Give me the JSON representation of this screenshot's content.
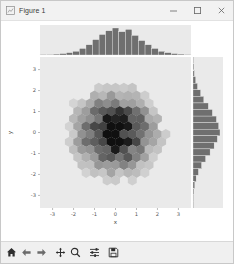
{
  "window": {
    "title": "Figure 1",
    "icon": "figure-icon",
    "controls": [
      {
        "name": "minimize-button",
        "glyph": "minimize-icon",
        "label": "Minimize"
      },
      {
        "name": "maximize-button",
        "glyph": "maximize-icon",
        "label": "Maximize"
      },
      {
        "name": "close-button",
        "glyph": "close-icon",
        "label": "Close"
      }
    ]
  },
  "toolbar": {
    "buttons": [
      {
        "name": "home-button",
        "icon": "home-icon",
        "label": "Reset original view"
      },
      {
        "name": "back-button",
        "icon": "arrow-left-icon",
        "label": "Back to previous view"
      },
      {
        "name": "forward-button",
        "icon": "arrow-right-icon",
        "label": "Forward to next view"
      },
      {
        "name": "pan-button",
        "icon": "move-cross-icon",
        "label": "Pan axes with left mouse, zoom with right"
      },
      {
        "name": "zoom-button",
        "icon": "magnifier-icon",
        "label": "Zoom to rectangle"
      },
      {
        "name": "configure-subplots-button",
        "icon": "sliders-icon",
        "label": "Configure subplots"
      },
      {
        "name": "save-button",
        "icon": "floppy-disk-icon",
        "label": "Save the figure"
      }
    ]
  },
  "chart_data": {
    "type": "scatter",
    "plot_kind": "hexbin-with-marginal-histograms",
    "title": "",
    "xlabel": "x",
    "ylabel": "y",
    "xlim": [
      -3.6,
      3.6
    ],
    "ylim": [
      -3.6,
      3.6
    ],
    "xticks": [
      -3,
      -2,
      -1,
      0,
      1,
      2,
      3
    ],
    "yticks": [
      -3,
      -2,
      -1,
      0,
      1,
      2,
      3
    ],
    "grid": false,
    "legend": null,
    "colormap": "gray_r",
    "axes_facecolor": "#eaeaea",
    "marginal_bar_color": "#6f6f6f",
    "hexbin": {
      "gridsize": 18,
      "center": [
        0.0,
        0.0
      ],
      "note": "bivariate normal density, counts mapped to grayscale, dark = high count"
    },
    "top_histogram": {
      "orientation": "vertical",
      "bin_centers": [
        -3.25,
        -2.95,
        -2.65,
        -2.35,
        -2.05,
        -1.75,
        -1.45,
        -1.15,
        -0.85,
        -0.55,
        -0.25,
        0.05,
        0.35,
        0.65,
        0.95,
        1.25,
        1.55,
        1.85,
        2.15,
        2.45,
        2.75,
        3.05,
        3.35
      ],
      "counts": [
        1,
        1,
        2,
        3,
        5,
        8,
        14,
        22,
        33,
        44,
        52,
        58,
        50,
        55,
        42,
        31,
        22,
        14,
        8,
        5,
        3,
        2,
        1
      ]
    },
    "right_histogram": {
      "orientation": "horizontal",
      "bin_centers": [
        3.35,
        3.05,
        2.75,
        2.45,
        2.15,
        1.85,
        1.55,
        1.25,
        0.95,
        0.65,
        0.35,
        0.05,
        -0.25,
        -0.55,
        -0.85,
        -1.15,
        -1.45,
        -1.75,
        -2.05,
        -2.35,
        -2.65,
        -2.95,
        -3.25
      ],
      "counts": [
        1,
        2,
        3,
        6,
        10,
        17,
        24,
        34,
        43,
        52,
        57,
        60,
        54,
        47,
        38,
        28,
        19,
        12,
        7,
        4,
        2,
        1,
        1
      ]
    }
  }
}
